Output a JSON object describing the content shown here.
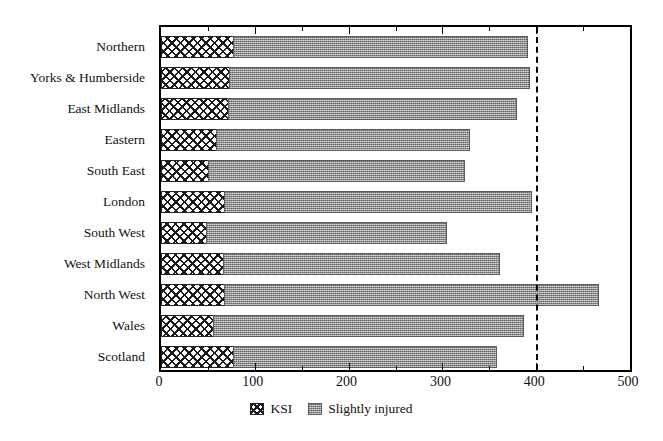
{
  "chart_data": {
    "type": "bar",
    "orientation": "horizontal",
    "stacked": true,
    "title": "",
    "subtitle": "",
    "xlabel": "",
    "ylabel": "",
    "xlim": [
      0,
      500
    ],
    "grid": false,
    "legend_position": "bottom-center",
    "x_ticks": [
      0,
      100,
      200,
      300,
      400,
      500
    ],
    "x_tick_labels": [
      "0",
      "100",
      "200",
      "300",
      "400",
      "500"
    ],
    "x_minor_tick_step": 50,
    "categories": [
      "Northern",
      "Yorks & Humberside",
      "East Midlands",
      "Eastern",
      "South East",
      "London",
      "South West",
      "West Midlands",
      "North West",
      "Wales",
      "Scotland"
    ],
    "series": [
      {
        "name": "KSI",
        "color": "#ffffff",
        "pattern": "cross-hatch",
        "values": [
          78,
          74,
          73,
          60,
          51,
          68,
          49,
          67,
          68,
          57,
          78
        ]
      },
      {
        "name": "Slightly injured",
        "color": "#8e8e8e",
        "pattern": "dotted-gray",
        "values": [
          314,
          320,
          308,
          270,
          274,
          329,
          257,
          296,
          400,
          331,
          281
        ]
      }
    ],
    "totals": [
      392,
      394,
      381,
      330,
      325,
      397,
      306,
      363,
      468,
      388,
      359
    ],
    "annotations": [
      {
        "type": "vertical-reference-line",
        "value": 400,
        "style": "dashed",
        "color": "#000000",
        "label": ""
      }
    ],
    "legend": [
      {
        "label": "KSI",
        "swatch": "cross-hatch-swatch"
      },
      {
        "label": "Slightly injured",
        "swatch": "gray-dotted-swatch"
      }
    ]
  }
}
